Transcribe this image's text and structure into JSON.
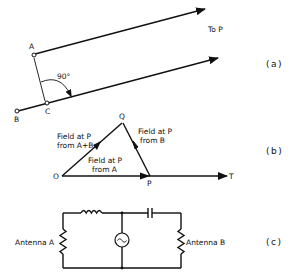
{
  "figure": {
    "panel_a": {
      "tag": "(a)",
      "point_a": "A",
      "point_b": "B",
      "point_c": "C",
      "angle_label": "90°",
      "direction_label": "To P"
    },
    "panel_b": {
      "tag": "(b)",
      "point_o": "O",
      "point_p": "P",
      "point_q": "Q",
      "point_t": "T",
      "vector_ab": [
        "Field at P",
        "from A+B"
      ],
      "vector_b": [
        "Field at P",
        "from B"
      ],
      "vector_a": [
        "Field at P",
        "from A"
      ]
    },
    "panel_c": {
      "tag": "(c)",
      "left_load": "Antenna A",
      "right_load": "Antenna B",
      "source_symbol": "~"
    }
  },
  "colors": {
    "ink": "#111111",
    "background": "#ffffff"
  }
}
